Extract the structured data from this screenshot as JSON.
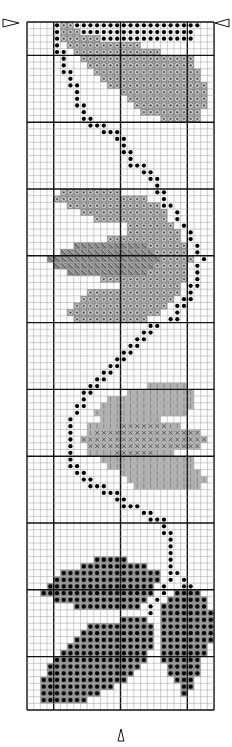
{
  "chart_data": {
    "type": "cross-stitch-pattern",
    "title": "",
    "grid": {
      "columns": 28,
      "rows": 103,
      "major_every": 10,
      "major_col_offset": 4,
      "major_row_offset": 5
    },
    "center_markers": {
      "side": "row 0 left & right",
      "bottom": "column 14"
    },
    "symbols": {
      "B": {
        "name": "backstitch-dot",
        "fill": "#ffffff",
        "mark": "dot"
      },
      "D": {
        "name": "dark-circle",
        "fill": "#8a8a8a",
        "mark": "ring"
      },
      "H": {
        "name": "dark-hatched",
        "fill": "#8a8a8a",
        "mark": "hatch"
      },
      "L": {
        "name": "light-vbar",
        "fill": "#b4b4b4",
        "mark": "vbar"
      },
      "X": {
        "name": "light-cross",
        "fill": "#b4b4b4",
        "mark": "cross"
      },
      "K": {
        "name": "dark-dot-fill",
        "fill": "#8a8a8a",
        "mark": "dot"
      }
    },
    "rows": [
      "....BDDBBBBBBBBBBBBBBBBBBB..",
      "....BDDDBBBBBBBBBBBBBBBBB...",
      "....BDDDDDDBBBBBBBBBBBBBB...",
      "....B.DDDDDDDDDDD...........",
      "....BB.DDDDDDDDDDDDD........",
      ".....B..DDDDDDDDDDDDDDDDD...",
      ".....B...DDDDDDDDDDDDDDDD...",
      ".....BB...DDDDDDDDDDDDDDDD..",
      "......B....DDDDDDDDDDDDDDD..",
      "......BB....DDDDDDDDDDDDDDD.",
      ".......B......DDDDDDDDDDDDD.",
      ".......B.......DDDDDDDDDDDD.",
      ".......BB.......DDDDDDDDDDD.",
      "........B........DDDDDDDDD..",
      "........BB..........DDDDDD..",
      ".........BBB................",
      "...........BBB..............",
      ".............BB.............",
      "..............B.............",
      "..............BB............",
      "...............B............",
      "...............BBB..........",
      ".................BB.........",
      "..................BB........",
      "...................B........",
      ".....DDDDDDDDD.....BB.......",
      "....DDDDDDDDDDDDDD..B.......",
      "......DDDDDDDDDDDDDDBB......",
      "........DDDDDDDDDDDDD.B.....",
      "..........DDDDDDDDDDD.B.....",
      "...............DDDDDDD.B....",
      "...............DDDDDDDD.B...",
      "............DDDDDDDDDDD.B...",
      ".......HHHHHHHHHHHDDDDDD.B...",
      ".....HHHHHHHHHHHHHHDDDDD.B...",
      "...HHHHHHHHHHHHHHHHHDDDDD.B..",
      "....HHHHHHHHHHHHHHHDDDDD.B...",
      "......HHHHHHHHHHHHDDDDDD.B...",
      "...........DDDDDDDDDDDDD.B...",
      "..............DDDDDDDDD.BB...",
      ".........DDDDDDDDDDDDDD.B....",
      "........DDDDDDDDDDDDDD.BB....",
      ".......DDDDDDDDDDDDDD.BB.....",
      "......DDDDDDDDDDDDDD..B......",
      ".......DDDDDDDDDDD...BB......",
      "..................BB........",
      ".................BB.........",
      "................BB..........",
      "...............BB...........",
      "..............BB............",
      ".............BB.............",
      "............BB..............",
      "...........BB...............",
      "..........BB................",
      ".........BB.......LLLLLL....",
      "........BB.....LLLLLLLLLL...",
      "........B...LLLLLLLLLLLLL...",
      ".......BB..LLLLLLLLLLLLLL...",
      ".......B..LLLLLLLLLLLLLL....",
      "......B....LLLLLLLLL........",
      "......B..LLLLLXXXXXXXLL.....",
      "......B..LXXXXXXXXXXXXXXXX..",
      "......B.XXXXXXXXXXXXXXXXXXX.",
      "......B..XXXXXXXXXXXXXXXXX..",
      "......B..LLLLXXXXXXLLL......",
      "......B....LLLLLLLLLLLLLL...",
      "......BB....LLLLLLLLLLLLL...",
      ".......BB.....LLLLLLLLLLLL..",
      "........BB.....LLLLLLLLLLLL.",
      ".........BBB....LLLLLLLLLL..",
      "...........BBB..............",
      ".............BB.............",
      "..............BBB...........",
      ".................BB.........",
      "..................BBB.......",
      "....................B.......",
      "....................BB......",
      ".....................B......",
      ".....................B......",
      ".....................B......",
      "..........KKKKK......B......",
      "........KKKKKKKKKK...B......",
      ".....KKKKKKKKKKKKKKK.BB.....",
      "....KKKKKKKKKKKKKKKK.B.B....",
      "...KKKKKKKKKKKKKKKK.B..BB...",
      "..KKKKKKKKKKKKKKKKK.B.KKKK..",
      "....KKKKKKKKKKKKKK.B.KKKKKK.",
      ".......KKKKKKKKKK.B.KKKKKKK.",
      "..................B.KKKKKKKK",
      "..............KKKK..KKKKKKKK",
      ".........KKKKKKKKKK.KKKKKKKK",
      "........KKKKKKKKKKK.KKKKKKKK",
      ".......KKKKKKKKKKKK.KKKKKKKK",
      "......KKKKKKKKKKKKK.KKKKKKK.",
      ".....KKKKKKKKKKKKK..KKKKKKK.",
      "....KKKKKKKKKKKKKK..KKKKKK..",
      "...KKKKKKKKKKKKKK....KKKKK..",
      "...KKKKKKKKKKKKK.....KKKKK..",
      "..KKKKKKKKKKKKK.......KKK...",
      "..KKKKKKKKKKK..........KK...",
      "..KKKKKKKKK............K....",
      "..KKKKKKK...................",
      "............................"
    ]
  },
  "layout": {
    "origin_x": 27,
    "origin_y": 22,
    "cell": 6.68,
    "minor_line": "#9a9a9a",
    "major_line": "#111111"
  }
}
